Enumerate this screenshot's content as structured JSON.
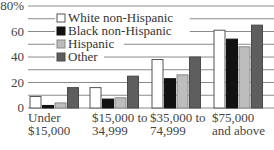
{
  "chart_data": {
    "type": "bar",
    "title": "",
    "xlabel": "",
    "ylabel": "",
    "ylim": [
      0,
      80
    ],
    "yticks": [
      {
        "value": 80,
        "label": "80%"
      },
      {
        "value": 60,
        "label": "60"
      },
      {
        "value": 40,
        "label": "40"
      },
      {
        "value": 20,
        "label": "20"
      },
      {
        "value": 0,
        "label": "0"
      }
    ],
    "gridlines": [
      0,
      10,
      20,
      30,
      40,
      50,
      60,
      70,
      80
    ],
    "grid": true,
    "legend_position": "top-left",
    "categories": [
      [
        "Under",
        "$15,000"
      ],
      [
        "$15,000 to",
        "34,999"
      ],
      [
        "$35,000 to",
        "74,999"
      ],
      [
        "$75,000",
        "and above"
      ]
    ],
    "series": [
      {
        "name": "White non-Hispanic",
        "color": "#ffffff",
        "stroke": "#555555",
        "values": [
          9,
          16,
          38,
          61
        ]
      },
      {
        "name": "Black non-Hispanic",
        "color": "#111111",
        "stroke": "#111111",
        "values": [
          2,
          7,
          23,
          54
        ]
      },
      {
        "name": "Hispanic",
        "color": "#bdbdbd",
        "stroke": "#888888",
        "values": [
          4,
          8,
          26,
          48
        ]
      },
      {
        "name": "Other",
        "color": "#5e5e5e",
        "stroke": "#4a4a4a",
        "values": [
          16,
          25,
          40,
          65
        ]
      }
    ]
  }
}
